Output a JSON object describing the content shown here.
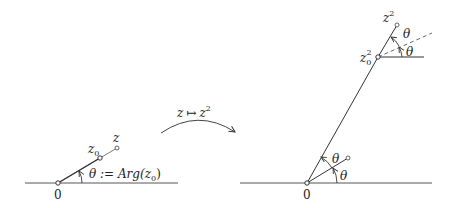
{
  "left_diagram": {
    "origin_label": "0",
    "z0_label": "z",
    "z0_sub": "0",
    "z_label": "z",
    "angle_label": "θ := Arg(z",
    "angle_sub": "0",
    "angle_close": ")"
  },
  "mapping": {
    "label_z": "z",
    "label_arrow": "↦",
    "label_z2": "z",
    "label_exp": "2"
  },
  "right_diagram": {
    "origin_label": "0",
    "theta_lower": "θ",
    "theta_upper": "θ",
    "z0sq_label": "z",
    "z0sq_sub": "0",
    "z0sq_sup": "2",
    "zsq_label": "z",
    "zsq_sup": "2",
    "theta_top_lower": "θ",
    "theta_top_upper": "θ"
  },
  "colors": {
    "stroke": "#333333",
    "background": "#ffffff"
  }
}
